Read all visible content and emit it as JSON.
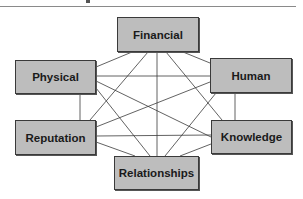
{
  "diagram": {
    "nodes": [
      {
        "id": "financial",
        "label": "Financial"
      },
      {
        "id": "physical",
        "label": "Physical"
      },
      {
        "id": "human",
        "label": "Human"
      },
      {
        "id": "reputation",
        "label": "Reputation"
      },
      {
        "id": "knowledge",
        "label": "Knowledge"
      },
      {
        "id": "relationships",
        "label": "Relationships"
      }
    ],
    "edges": [
      [
        "financial",
        "physical"
      ],
      [
        "financial",
        "human"
      ],
      [
        "financial",
        "reputation"
      ],
      [
        "financial",
        "knowledge"
      ],
      [
        "financial",
        "relationships"
      ],
      [
        "physical",
        "human"
      ],
      [
        "physical",
        "reputation"
      ],
      [
        "physical",
        "knowledge"
      ],
      [
        "physical",
        "relationships"
      ],
      [
        "human",
        "reputation"
      ],
      [
        "human",
        "knowledge"
      ],
      [
        "human",
        "relationships"
      ],
      [
        "reputation",
        "knowledge"
      ],
      [
        "reputation",
        "relationships"
      ],
      [
        "knowledge",
        "relationships"
      ]
    ]
  }
}
